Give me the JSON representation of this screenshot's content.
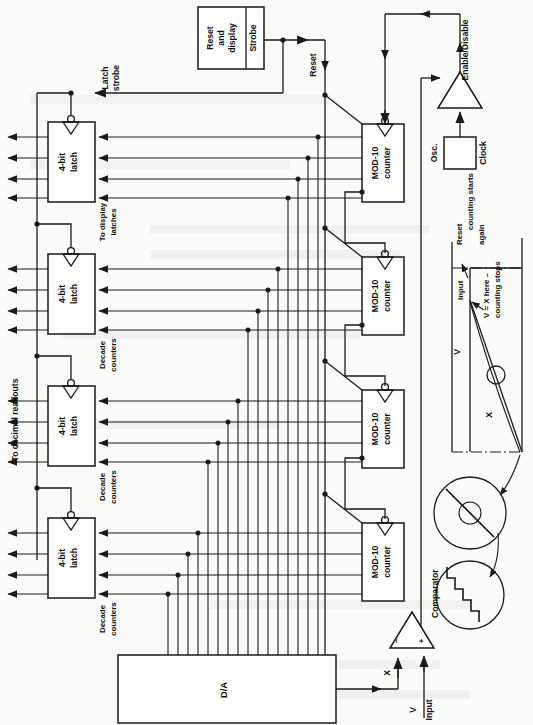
{
  "diagram": {
    "orientation": "rotated-90-ccw",
    "background_color": "#fbfbfa",
    "line_color": "#1a1a1a"
  },
  "blocks": {
    "reset_display": {
      "label_line1": "Reset",
      "label_line2": "and",
      "label_line3": "display",
      "strobe_label": "Strobe"
    },
    "clock": {
      "osc_label": "Osc.",
      "clock_label": "Clock"
    },
    "da": {
      "label": "D/A"
    },
    "comparator": {
      "label": "Comparator",
      "minus_input": "−",
      "plus_input": "+"
    },
    "gate": {
      "label": "Enable/Disable"
    },
    "latches": [
      {
        "label_line1": "4-bit",
        "label_line2": "latch"
      },
      {
        "label_line1": "4-bit",
        "label_line2": "latch"
      },
      {
        "label_line1": "4-bit",
        "label_line2": "latch"
      },
      {
        "label_line1": "4-bit",
        "label_line2": "latch"
      }
    ],
    "counters": [
      {
        "label_line1": "MOD-10",
        "label_line2": "counter"
      },
      {
        "label_line1": "MOD-10",
        "label_line2": "counter"
      },
      {
        "label_line1": "MOD-10",
        "label_line2": "counter"
      },
      {
        "label_line1": "MOD-10",
        "label_line2": "counter"
      }
    ]
  },
  "signal_labels": {
    "latch_strobe_line1": "Latch",
    "latch_strobe_line2": "strobe",
    "reset": "Reset",
    "to_decimal_readouts": "To decimal readouts",
    "to_display_latches_line1": "To display",
    "to_display_latches_line2": "latches",
    "decade_counters_line1": "Decade",
    "decade_counters_line2": "counters",
    "x": "X",
    "v": "V",
    "input": "Input"
  },
  "decade_counter_labels": [
    {
      "line1": "Decade",
      "line2": "counters"
    },
    {
      "line1": "Decade",
      "line2": "counters"
    },
    {
      "line1": "Decade",
      "line2": "counters"
    }
  ],
  "waveform_inset": {
    "reset_note_line1": "Reset",
    "reset_note_line2": "counting starts",
    "reset_note_line3": "again",
    "input_label": "Input",
    "v_axis_label": "V",
    "x_label": "X",
    "stop_note_line1": "V = X here –",
    "stop_note_line2": "counting stops"
  },
  "detail_insets": {
    "ramp_magnifier": "staircase-ramp-close-up",
    "step_magnifier": "staircase-steps-close-up"
  }
}
